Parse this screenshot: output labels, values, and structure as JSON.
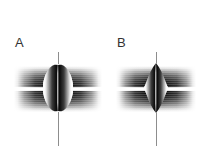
{
  "figure": {
    "width": 208,
    "height": 168,
    "background_color": "#ffffff",
    "type": "grayscale-scientific-figure"
  },
  "panels": [
    {
      "label": "A",
      "label_x": 15,
      "label_y": 36,
      "panel_left": 0,
      "axis": {
        "center_x": 58,
        "top_y": 52,
        "bottom_y": 146,
        "color": "#8d8d8d",
        "width_px": 1
      },
      "bands": {
        "left_x": 14,
        "width": 88,
        "top_band_y": 66,
        "bottom_band_y": 90,
        "band_height": 22,
        "dark_color": "#050505",
        "gap_y": 87,
        "gap_height": 4
      },
      "lens": {
        "shape": "rounded-oval",
        "center_x": 58,
        "center_y": 88,
        "width": 30,
        "height": 48,
        "rim_color": "#fdfdfd",
        "core_color": "#070707"
      }
    },
    {
      "label": "B",
      "label_x": 117,
      "label_y": 36,
      "panel_left": 104,
      "axis": {
        "center_x": 156,
        "top_y": 52,
        "bottom_y": 146,
        "color": "#8d8d8d",
        "width_px": 1
      },
      "bands": {
        "left_x": 116,
        "width": 80,
        "top_band_y": 66,
        "bottom_band_y": 90,
        "band_height": 22,
        "dark_color": "#050505",
        "gap_y": 87,
        "gap_height": 4
      },
      "lens": {
        "shape": "pointed-oval",
        "center_x": 156,
        "center_y": 88,
        "width": 24,
        "height": 50,
        "rim_color": "#fdfdfd",
        "core_color": "#070707"
      }
    }
  ],
  "colors": {
    "background": "#ffffff",
    "label_text": "#333333",
    "axis_line": "#8d8d8d",
    "band_dark": "#050505",
    "lens_rim": "#fdfdfd"
  }
}
